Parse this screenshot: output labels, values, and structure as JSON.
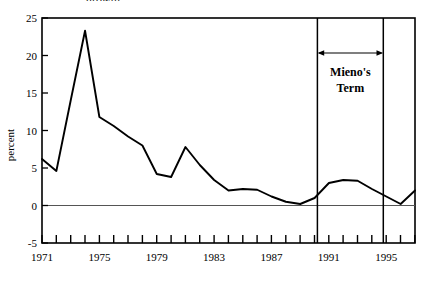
{
  "figure": {
    "title_fragment": "growth",
    "accent_color": "#000000",
    "background_color": "#ffffff"
  },
  "axes": {
    "y_title": "percent",
    "y_ticks": [
      "25",
      "20",
      "15",
      "10",
      "5",
      "0",
      "-5"
    ],
    "x_ticks": [
      "1971",
      "1975",
      "1979",
      "1983",
      "1987",
      "1991",
      "1995"
    ]
  },
  "annotations": {
    "span_label_line1": "Mieno's",
    "span_label_line2": "Term",
    "span_start_year": 1990.2,
    "span_end_year": 1994.8
  },
  "chart_data": {
    "type": "line",
    "title": "growth",
    "xlabel": "",
    "ylabel": "percent",
    "xlim": [
      1971,
      1997
    ],
    "ylim": [
      -5,
      25
    ],
    "grid": false,
    "legend": null,
    "x_tick_labels": [
      "1971",
      "1975",
      "1979",
      "1983",
      "1987",
      "1991",
      "1995"
    ],
    "x_tick_values": [
      1971,
      1975,
      1979,
      1983,
      1987,
      1991,
      1995
    ],
    "x_minor_tick_interval": 1,
    "y_tick_values": [
      -5,
      0,
      5,
      10,
      15,
      20,
      25
    ],
    "zero_line": 0,
    "series": [
      {
        "name": "growth",
        "x": [
          1971,
          1972,
          1973,
          1974,
          1975,
          1976,
          1977,
          1978,
          1979,
          1980,
          1981,
          1982,
          1983,
          1984,
          1985,
          1986,
          1987,
          1988,
          1989,
          1990,
          1991,
          1992,
          1993,
          1994,
          1995,
          1996,
          1997
        ],
        "values": [
          6.2,
          4.6,
          14.0,
          23.3,
          11.8,
          10.6,
          9.2,
          8.0,
          4.2,
          3.8,
          7.8,
          5.4,
          3.4,
          2.0,
          2.2,
          2.1,
          1.2,
          0.5,
          0.2,
          1.0,
          3.0,
          3.4,
          3.3,
          2.2,
          1.2,
          0.2,
          2.0
        ]
      }
    ],
    "annotations": [
      {
        "type": "vertical-line",
        "x": 1990.2
      },
      {
        "type": "vertical-line",
        "x": 1994.8
      },
      {
        "type": "double-arrow",
        "x_start": 1990.2,
        "x_end": 1994.8,
        "y": 20.5,
        "label": "Mieno's Term"
      }
    ]
  }
}
